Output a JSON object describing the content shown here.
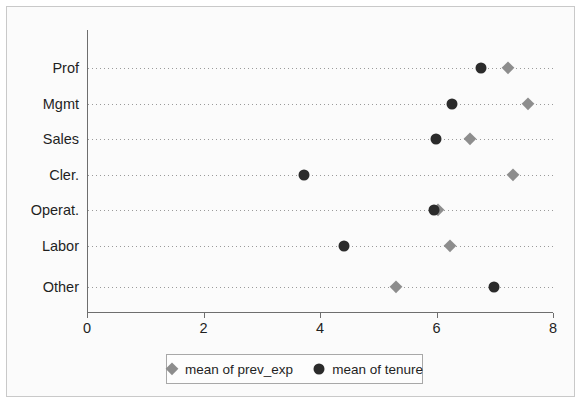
{
  "chart_data": {
    "type": "scatter",
    "subtype": "dot-plot",
    "title": "",
    "subtitle": "",
    "xlabel": "",
    "ylabel": "",
    "xlim": [
      0,
      8
    ],
    "xticks": [
      0,
      2,
      4,
      6,
      8
    ],
    "xtick_labels": [
      "0",
      "2",
      "4",
      "6",
      "8"
    ],
    "grid": "horizontal-dotted",
    "legend_position": "bottom-center",
    "categories": [
      "Prof",
      "Mgmt",
      "Sales",
      "Cler.",
      "Operat.",
      "Labor",
      "Other"
    ],
    "series": [
      {
        "name": "mean of prev_exp",
        "marker": "diamond",
        "color": "#8d8d8d",
        "values": [
          7.23,
          7.57,
          6.57,
          7.32,
          6.02,
          6.23,
          5.3
        ]
      },
      {
        "name": "mean of tenure",
        "marker": "circle",
        "color": "#2b2b2b",
        "values": [
          6.76,
          6.27,
          5.99,
          3.72,
          5.95,
          4.41,
          6.99
        ]
      }
    ]
  },
  "legend": {
    "items": [
      {
        "label": "mean of prev_exp",
        "marker": "diamond-icon"
      },
      {
        "label": "mean of tenure",
        "marker": "circle-icon"
      }
    ]
  },
  "colors": {
    "prev_exp": "#8d8d8d",
    "tenure": "#2b2b2b",
    "axis": "#6e6e6e",
    "gridline": "#9a9a9a",
    "background": "#fbfbfb"
  }
}
